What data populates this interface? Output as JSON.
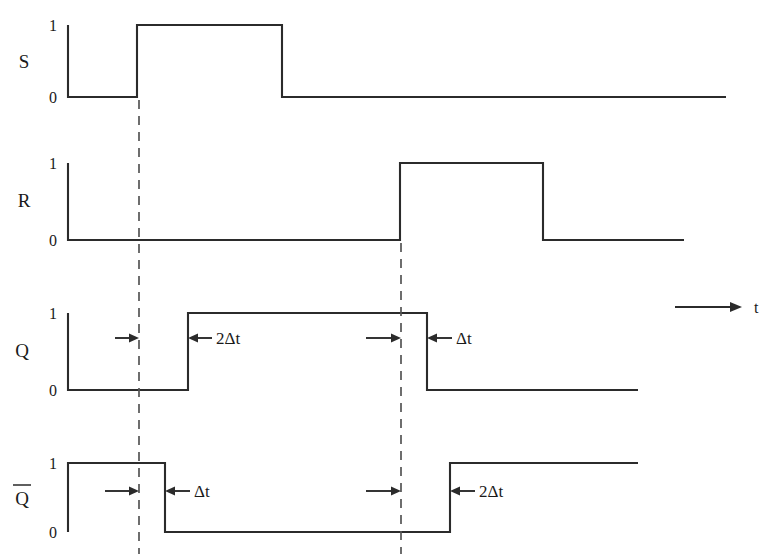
{
  "figure": {
    "type": "timing-diagram",
    "background_color": "#ffffff",
    "line_color": "#2b2b2b",
    "dash_color": "#555555"
  },
  "time_axis": {
    "label": "t",
    "arrow": "right-arrow-icon",
    "x_start": 675,
    "x_end": 742,
    "y": 307
  },
  "level_labels": {
    "high": "1",
    "low": "0"
  },
  "signals": [
    {
      "name": "S",
      "label": "S",
      "row_index": 0,
      "y_high": 25,
      "y_low": 97,
      "x_start": 68,
      "x_end": 726,
      "label_x": 24,
      "label_y": 68,
      "high_tick_y": 31,
      "low_tick_y": 103,
      "transitions": [
        {
          "x": 68,
          "to": "1"
        },
        {
          "x": 68,
          "to": "0"
        },
        {
          "x": 137,
          "to": "1"
        },
        {
          "x": 282,
          "to": "0"
        }
      ],
      "points": "68,25 68,97 137,97 137,25 282,25 282,97 726,97"
    },
    {
      "name": "R",
      "label": "R",
      "row_index": 1,
      "y_high": 163,
      "y_low": 240,
      "x_start": 68,
      "x_end": 684,
      "label_x": 24,
      "label_y": 207,
      "high_tick_y": 169,
      "low_tick_y": 246,
      "transitions": [
        {
          "x": 68,
          "to": "1"
        },
        {
          "x": 68,
          "to": "0"
        },
        {
          "x": 400,
          "to": "1"
        },
        {
          "x": 543,
          "to": "0"
        }
      ],
      "points": "68,163 68,240 400,240 400,163 543,163 543,240 684,240"
    },
    {
      "name": "Q",
      "label": "Q",
      "row_index": 2,
      "y_high": 313,
      "y_low": 390,
      "x_start": 68,
      "x_end": 638,
      "label_x": 22,
      "label_y": 357,
      "high_tick_y": 319,
      "low_tick_y": 396,
      "transitions": [
        {
          "x": 68,
          "to": "1"
        },
        {
          "x": 68,
          "to": "0"
        },
        {
          "x": 188,
          "to": "1"
        },
        {
          "x": 427,
          "to": "0"
        }
      ],
      "points": "68,313 68,390 188,390 188,313 427,313 427,390 638,390"
    },
    {
      "name": "Qbar",
      "label": "Q",
      "has_overbar": true,
      "row_index": 3,
      "y_high": 463,
      "y_low": 532,
      "x_start": 68,
      "x_end": 638,
      "label_x": 22,
      "label_y": 505,
      "high_tick_y": 469,
      "low_tick_y": 538,
      "transitions": [
        {
          "x": 68,
          "to": "0"
        },
        {
          "x": 68,
          "to": "1"
        },
        {
          "x": 165,
          "to": "0"
        },
        {
          "x": 450,
          "to": "1"
        }
      ],
      "points": "68,532 68,463 165,463 165,532 450,532 450,463 638,463"
    }
  ],
  "reference_lines": [
    {
      "name": "set-edge-reference",
      "x": 139,
      "y_top": 100,
      "y_bottom": 554
    },
    {
      "name": "reset-edge-reference",
      "x": 401,
      "y_top": 243,
      "y_bottom": 554
    }
  ],
  "annotations": [
    {
      "id": "q-rise-delay",
      "signal": "Q",
      "text": "2Δt",
      "y": 338,
      "left_arrow": {
        "tail_x": 115,
        "head_x": 139,
        "direction": "right"
      },
      "right_arrow": {
        "tail_x": 212,
        "head_x": 188,
        "direction": "left"
      },
      "text_x": 216,
      "text_anchor": "start"
    },
    {
      "id": "q-fall-delay",
      "signal": "Q",
      "text": "Δt",
      "y": 338,
      "left_arrow": {
        "tail_x": 366,
        "head_x": 401,
        "direction": "right"
      },
      "right_arrow": {
        "tail_x": 452,
        "head_x": 427,
        "direction": "left"
      },
      "text_x": 456,
      "text_anchor": "start"
    },
    {
      "id": "qbar-fall-delay",
      "signal": "Qbar",
      "text": "Δt",
      "y": 491,
      "left_arrow": {
        "tail_x": 105,
        "head_x": 139,
        "direction": "right"
      },
      "right_arrow": {
        "tail_x": 190,
        "head_x": 165,
        "direction": "left"
      },
      "text_x": 194,
      "text_anchor": "start"
    },
    {
      "id": "qbar-rise-delay",
      "signal": "Qbar",
      "text": "2Δt",
      "y": 491,
      "left_arrow": {
        "tail_x": 366,
        "head_x": 401,
        "direction": "right"
      },
      "right_arrow": {
        "tail_x": 475,
        "head_x": 450,
        "direction": "left"
      },
      "text_x": 479,
      "text_anchor": "start"
    }
  ]
}
